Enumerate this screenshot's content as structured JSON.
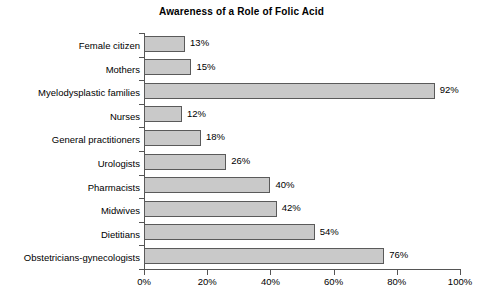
{
  "chart_data": {
    "type": "bar",
    "orientation": "horizontal",
    "title": "Awareness of a Role of Folic Acid",
    "xlabel": "",
    "ylabel": "",
    "xlim": [
      0,
      100
    ],
    "grid": false,
    "legend": null,
    "value_suffix": "%",
    "categories": [
      "Female citizen",
      "Mothers",
      "Myelodysplastic families",
      "Nurses",
      "General practitioners",
      "Urologists",
      "Pharmacists",
      "Midwives",
      "Dietitians",
      "Obstetricians-gynecologists"
    ],
    "values": [
      13,
      15,
      92,
      12,
      18,
      26,
      40,
      42,
      54,
      76
    ],
    "data_labels": [
      "13%",
      "15%",
      "92%",
      "12%",
      "18%",
      "26%",
      "40%",
      "42%",
      "54%",
      "76%"
    ],
    "xticks": [
      0,
      20,
      40,
      60,
      80,
      100
    ],
    "xtick_labels": [
      "0%",
      "20%",
      "40%",
      "60%",
      "80%",
      "100%"
    ],
    "colors": {
      "bar_fill": "#c9c9c9",
      "bar_border": "#5a5a5a",
      "axis": "#555555",
      "text": "#000000",
      "background": "#ffffff"
    }
  }
}
